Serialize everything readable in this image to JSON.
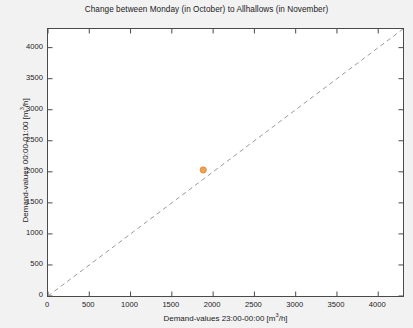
{
  "chart_data": {
    "type": "scatter",
    "title": "Change between Monday (in October) to Allhallows (in November)",
    "xlabel": "Demand-values 23:00-00:00 [m³/h]",
    "ylabel": "Demand-values 00:00-01:00 [m³/h]",
    "xlim": [
      0,
      4300
    ],
    "ylim": [
      0,
      4300
    ],
    "xticks": [
      0,
      500,
      1000,
      1500,
      2000,
      2500,
      3000,
      3500,
      4000
    ],
    "yticks": [
      0,
      500,
      1000,
      1500,
      2000,
      2500,
      3000,
      3500,
      4000
    ],
    "xtick_labels": [
      "0",
      "500",
      "1000",
      "1500",
      "2000",
      "2500",
      "3000",
      "3500",
      "4000"
    ],
    "ytick_labels": [
      "0",
      "500",
      "1000",
      "1500",
      "2000",
      "2500",
      "3000",
      "3500",
      "4000"
    ],
    "grid": false,
    "legend": "none",
    "series": [
      {
        "name": "demand-pairs",
        "marker": "circle",
        "color": "#e8903a",
        "points": [
          {
            "x": 1880,
            "y": 2030
          }
        ]
      }
    ],
    "reference_line": {
      "name": "identity-line",
      "style": "dashed",
      "color": "#9a9a9a",
      "from": {
        "x": 0,
        "y": 0
      },
      "to": {
        "x": 4300,
        "y": 4300
      }
    }
  },
  "figure": {
    "background_color": "#f2f2f2",
    "plot_background_color": "#ffffff",
    "axis_color": "#4a4a4a"
  }
}
